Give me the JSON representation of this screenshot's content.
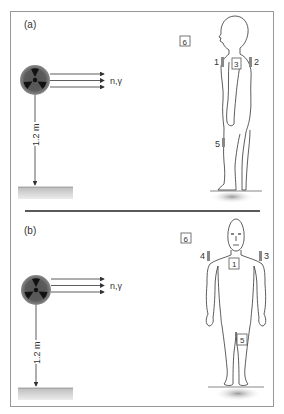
{
  "figure": {
    "panels": [
      {
        "id": "a",
        "label": "(a)",
        "view": "side",
        "radiation_label": "n,γ",
        "height_label": "1.2 m",
        "dosimeter_labels": [
          "1",
          "2",
          "3",
          "5",
          "6"
        ]
      },
      {
        "id": "b",
        "label": "(b)",
        "view": "front",
        "radiation_label": "n,γ",
        "height_label": "1.2 m",
        "dosimeter_labels": [
          "1",
          "3",
          "4",
          "5",
          "6"
        ]
      }
    ],
    "colors": {
      "frame": "#888888",
      "line": "#333333",
      "source_outer": "#6e6e6e",
      "source_inner": "#1a1a1a",
      "ground": "#c8c8c8"
    }
  }
}
